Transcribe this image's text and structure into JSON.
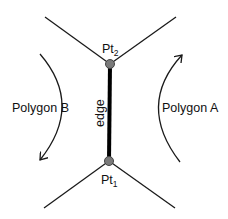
{
  "diagram": {
    "labels": {
      "pt2_main": "Pt",
      "pt2_sub": "2",
      "pt1_main": "Pt",
      "pt1_sub": "1",
      "edge": "edge",
      "polygon_a": "Polygon A",
      "polygon_b": "Polygon B"
    },
    "points": {
      "pt2": {
        "x": 110,
        "y": 64
      },
      "pt1": {
        "x": 109,
        "y": 161
      }
    },
    "colors": {
      "line": "#1a1a1a",
      "vertex_fill": "#7a7a7a",
      "vertex_stroke": "#444444",
      "edge": "#000000"
    }
  }
}
